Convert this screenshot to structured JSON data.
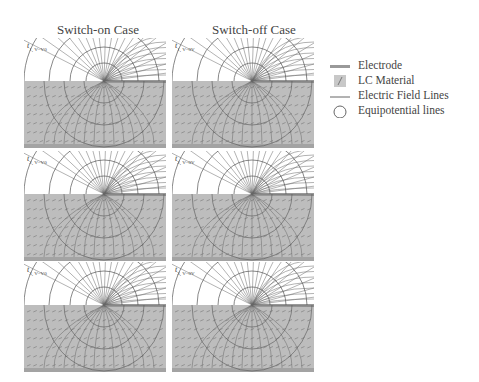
{
  "columns": [
    {
      "title": "Switch-on Case"
    },
    {
      "title": "Switch-off Case"
    }
  ],
  "panels": [
    {
      "row": 1,
      "case": "on",
      "label_main": "t",
      "label_sub": "1, V=V0"
    },
    {
      "row": 1,
      "case": "off",
      "label_main": "t",
      "label_sub": "1, V=0V"
    },
    {
      "row": 2,
      "case": "on",
      "label_main": "t",
      "label_sub": "2, V=V0"
    },
    {
      "row": 2,
      "case": "off",
      "label_main": "t",
      "label_sub": "2, V=0V"
    },
    {
      "row": 3,
      "case": "on",
      "label_main": "t",
      "label_sub": "3, V=V0"
    },
    {
      "row": 3,
      "case": "off",
      "label_main": "t",
      "label_sub": "3, V=0V"
    }
  ],
  "legend": {
    "items": [
      {
        "icon": "electrode-swatch",
        "label": "Electrode"
      },
      {
        "icon": "lc-material-swatch",
        "label": "LC Material"
      },
      {
        "icon": "field-line-swatch",
        "label": "Electric Field Lines"
      },
      {
        "icon": "circle-outline",
        "label": "Equipotential lines"
      }
    ]
  },
  "colors": {
    "lc_fill": "#b8b8b8",
    "electrode": "#9a9a9a",
    "lines": "#555555",
    "text": "#444444"
  }
}
